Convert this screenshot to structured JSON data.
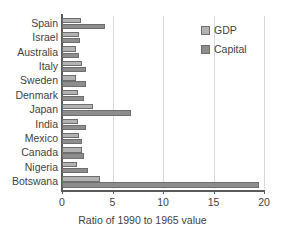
{
  "chart_data": {
    "type": "bar",
    "orientation": "horizontal",
    "title": "",
    "xlabel": "Ratio of 1990 to 1965 value",
    "ylabel": "",
    "xlim": [
      0,
      20
    ],
    "xticks": [
      0,
      5,
      10,
      15,
      20
    ],
    "xticklabels": [
      "0",
      "5",
      "10",
      "15",
      "20"
    ],
    "grid": "vertical-gridlines-at-xticks",
    "legend_position": "top-right",
    "categories": [
      "Spain",
      "Israel",
      "Australia",
      "Italy",
      "Sweden",
      "Denmark",
      "Japan",
      "India",
      "Mexico",
      "Canada",
      "Nigeria",
      "Botswana"
    ],
    "series": [
      {
        "name": "GDP",
        "color": "#b2b2b2",
        "values": [
          1.9,
          1.7,
          1.35,
          2.0,
          1.4,
          1.55,
          3.1,
          1.6,
          1.7,
          2.0,
          1.5,
          3.8
        ]
      },
      {
        "name": "Capital",
        "color": "#8d8d8d",
        "values": [
          4.3,
          1.75,
          1.7,
          2.35,
          2.35,
          2.2,
          6.8,
          2.4,
          2.0,
          2.2,
          2.6,
          19.5
        ]
      }
    ]
  },
  "legend": {
    "items": [
      {
        "label": "GDP",
        "swatch": "gdp"
      },
      {
        "label": "Capital",
        "swatch": "capital"
      }
    ]
  }
}
